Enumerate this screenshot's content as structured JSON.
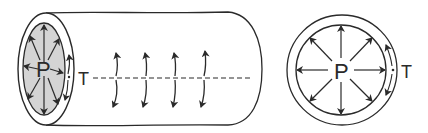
{
  "figure": {
    "colors": {
      "stroke": "#2a2a2a",
      "lumen_fill": "#d4d4d4",
      "background": "#ffffff"
    },
    "left_panel": {
      "name": "cylinder-view",
      "pressure_label": "P",
      "tension_label": "T",
      "radial_arrows": 8,
      "wall_tension_arrows": 4
    },
    "right_panel": {
      "name": "cross-section-view",
      "pressure_label": "P",
      "tension_label": "T",
      "radial_arrows": 8
    }
  }
}
